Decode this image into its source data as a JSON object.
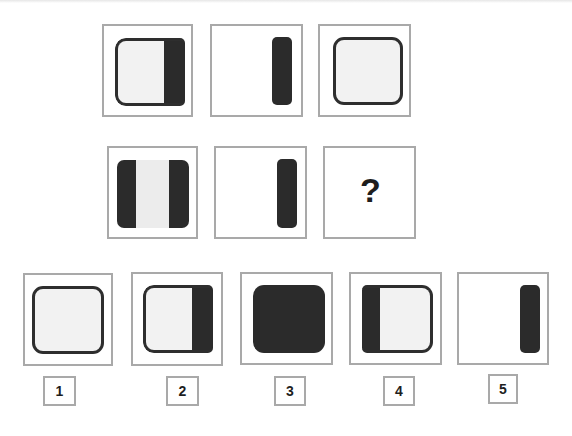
{
  "puzzle": {
    "rows": [
      {
        "cells": [
          {
            "figure": "rounded-square-light-with-dark-right-band"
          },
          {
            "figure": "dark-vertical-bar-right"
          },
          {
            "figure": "rounded-square-light"
          }
        ]
      },
      {
        "cells": [
          {
            "figure": "rounded-square-dark-with-light-center-stripe"
          },
          {
            "figure": "dark-vertical-bar-right"
          },
          {
            "figure": "question",
            "text": "?"
          }
        ]
      }
    ],
    "options": [
      {
        "label": "1",
        "figure": "rounded-square-light"
      },
      {
        "label": "2",
        "figure": "rounded-square-light-with-dark-right-band"
      },
      {
        "label": "3",
        "figure": "rounded-square-dark"
      },
      {
        "label": "4",
        "figure": "rounded-square-light-with-dark-left-band"
      },
      {
        "label": "5",
        "figure": "dark-vertical-bar-right"
      }
    ]
  },
  "colors": {
    "dark_fill": "#2b2b2b",
    "light_fill": "#f2f2f2",
    "cell_border": "#a9a9a9",
    "outline": "#2e2e2e"
  }
}
